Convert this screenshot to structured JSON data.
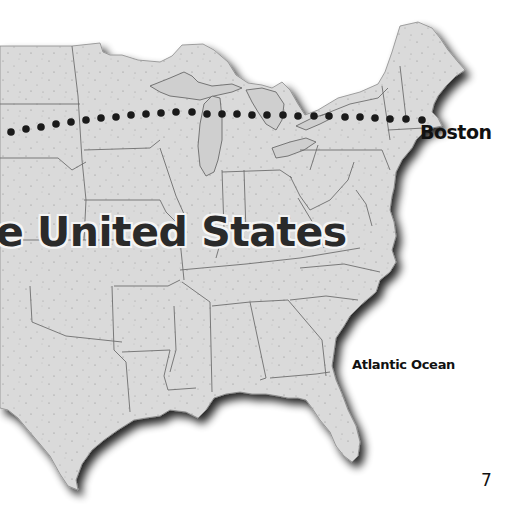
{
  "map": {
    "title_fragment": "e United States",
    "labels": {
      "city": "Boston",
      "ocean": "Atlantic Ocean"
    },
    "route": {
      "style": "dotted",
      "color": "#1a1a1a",
      "end_city": "Boston"
    },
    "land_color": "#d9d9d9",
    "border_color": "#707070",
    "shadow_color": "#2a2a2a"
  },
  "page": {
    "number": "7"
  }
}
